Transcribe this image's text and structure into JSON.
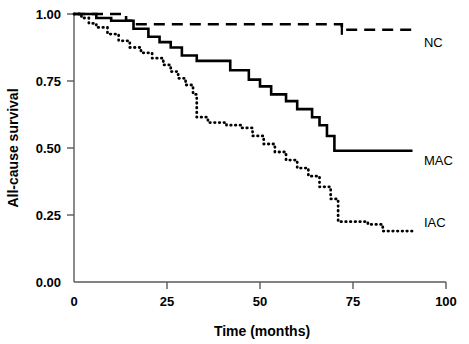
{
  "chart_data": {
    "type": "line",
    "title": "",
    "xlabel": "Time (months)",
    "ylabel": "All-cause survival",
    "xlim": [
      0,
      100
    ],
    "ylim": [
      0.0,
      1.0
    ],
    "xticks": [
      0,
      25,
      50,
      75,
      100
    ],
    "xticklabels": [
      "0",
      "25",
      "50",
      "75",
      "100"
    ],
    "yticks": [
      0.0,
      0.25,
      0.5,
      0.75,
      1.0
    ],
    "yticklabels": [
      "0.00",
      "0.25",
      "0.50",
      "0.75",
      "1.00"
    ],
    "grid": false,
    "legend_position": "right-inline",
    "series": [
      {
        "name": "NC",
        "label": "NC",
        "style": "dashed",
        "label_x": 93,
        "label_y": 0.895,
        "final_value": 0.94,
        "points": [
          [
            0,
            1.0
          ],
          [
            14,
            1.0
          ],
          [
            14,
            0.975
          ],
          [
            16,
            0.975
          ],
          [
            16,
            0.962
          ],
          [
            72,
            0.962
          ],
          [
            72,
            0.941
          ],
          [
            91,
            0.941
          ]
        ],
        "censor_times": [
          72
        ]
      },
      {
        "name": "MAC",
        "label": "MAC",
        "style": "solid",
        "label_x": 93,
        "label_y": 0.455,
        "final_value": 0.49,
        "points": [
          [
            0,
            1.0
          ],
          [
            6,
            1.0
          ],
          [
            6,
            0.985
          ],
          [
            10,
            0.985
          ],
          [
            10,
            0.975
          ],
          [
            16,
            0.975
          ],
          [
            16,
            0.945
          ],
          [
            20,
            0.945
          ],
          [
            20,
            0.915
          ],
          [
            23,
            0.915
          ],
          [
            23,
            0.895
          ],
          [
            26,
            0.895
          ],
          [
            26,
            0.875
          ],
          [
            29,
            0.875
          ],
          [
            29,
            0.845
          ],
          [
            33,
            0.845
          ],
          [
            33,
            0.825
          ],
          [
            42,
            0.825
          ],
          [
            42,
            0.79
          ],
          [
            47,
            0.79
          ],
          [
            47,
            0.755
          ],
          [
            50,
            0.755
          ],
          [
            50,
            0.73
          ],
          [
            53,
            0.73
          ],
          [
            53,
            0.7
          ],
          [
            57,
            0.7
          ],
          [
            57,
            0.675
          ],
          [
            60,
            0.675
          ],
          [
            60,
            0.645
          ],
          [
            64,
            0.645
          ],
          [
            64,
            0.615
          ],
          [
            66,
            0.615
          ],
          [
            66,
            0.585
          ],
          [
            68,
            0.585
          ],
          [
            68,
            0.545
          ],
          [
            70,
            0.545
          ],
          [
            70,
            0.49
          ],
          [
            72,
            0.49
          ],
          [
            91,
            0.49
          ]
        ],
        "censor_times": []
      },
      {
        "name": "IAC",
        "label": "IAC",
        "style": "dotted",
        "label_x": 93,
        "label_y": 0.225,
        "final_value": 0.19,
        "points": [
          [
            0,
            1.0
          ],
          [
            2,
            1.0
          ],
          [
            2,
            0.985
          ],
          [
            4,
            0.985
          ],
          [
            4,
            0.965
          ],
          [
            6,
            0.965
          ],
          [
            6,
            0.95
          ],
          [
            9,
            0.95
          ],
          [
            9,
            0.925
          ],
          [
            12,
            0.925
          ],
          [
            12,
            0.9
          ],
          [
            15,
            0.9
          ],
          [
            15,
            0.875
          ],
          [
            18,
            0.875
          ],
          [
            18,
            0.855
          ],
          [
            21,
            0.855
          ],
          [
            21,
            0.835
          ],
          [
            24,
            0.835
          ],
          [
            24,
            0.81
          ],
          [
            26,
            0.81
          ],
          [
            26,
            0.785
          ],
          [
            28,
            0.785
          ],
          [
            28,
            0.76
          ],
          [
            30,
            0.76
          ],
          [
            30,
            0.735
          ],
          [
            32,
            0.735
          ],
          [
            32,
            0.7
          ],
          [
            33,
            0.7
          ],
          [
            33,
            0.615
          ],
          [
            36,
            0.615
          ],
          [
            36,
            0.595
          ],
          [
            41,
            0.595
          ],
          [
            41,
            0.585
          ],
          [
            45,
            0.585
          ],
          [
            45,
            0.575
          ],
          [
            48,
            0.575
          ],
          [
            48,
            0.545
          ],
          [
            51,
            0.545
          ],
          [
            51,
            0.515
          ],
          [
            54,
            0.515
          ],
          [
            54,
            0.485
          ],
          [
            57,
            0.485
          ],
          [
            57,
            0.455
          ],
          [
            60,
            0.455
          ],
          [
            60,
            0.425
          ],
          [
            63,
            0.425
          ],
          [
            63,
            0.395
          ],
          [
            66,
            0.395
          ],
          [
            66,
            0.355
          ],
          [
            69,
            0.355
          ],
          [
            69,
            0.31
          ],
          [
            71,
            0.31
          ],
          [
            71,
            0.225
          ],
          [
            79,
            0.225
          ],
          [
            79,
            0.215
          ],
          [
            83,
            0.215
          ],
          [
            83,
            0.19
          ],
          [
            91,
            0.19
          ]
        ],
        "censor_times": []
      }
    ]
  }
}
